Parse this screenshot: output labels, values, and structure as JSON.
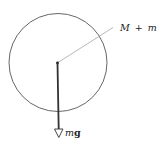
{
  "diagram": {
    "body_label_mass1": "M",
    "body_label_plus": "+",
    "body_label_mass2": "m",
    "force_label_mass": "m",
    "force_label_g": "g",
    "colors": {
      "circle": "#555555",
      "leader": "#999999",
      "arrow": "#333333",
      "text": "#222222"
    }
  }
}
